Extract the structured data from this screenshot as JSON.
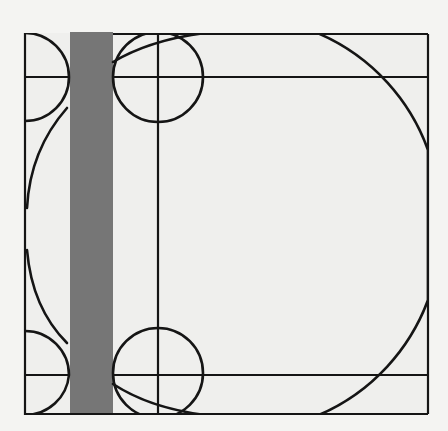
{
  "diagram": {
    "title": "",
    "colors": {
      "background": "#f4f4f2",
      "paper": "#efefed",
      "bar": "#767676",
      "line": "#151515"
    },
    "frame": {
      "x": 25,
      "y": 33,
      "width": 403,
      "height": 382
    },
    "bar": {
      "x": 70,
      "y": 32,
      "width": 43,
      "height": 383
    },
    "horizontal_lines": [
      {
        "y": 77
      },
      {
        "y": 375
      }
    ],
    "vertical_lines": [
      {
        "x": 158
      }
    ],
    "circles": [
      {
        "name": "top-left-half-circle",
        "cx": 25,
        "cy": 77,
        "r": 44
      },
      {
        "name": "bottom-left-half-circle",
        "cx": 25,
        "cy": 375,
        "r": 44
      },
      {
        "name": "top-circle",
        "cx": 158,
        "cy": 77,
        "r": 45
      },
      {
        "name": "bottom-circle",
        "cx": 158,
        "cy": 373,
        "r": 45
      },
      {
        "name": "large-circle",
        "cx": 226,
        "cy": 224,
        "r": 201
      }
    ]
  }
}
